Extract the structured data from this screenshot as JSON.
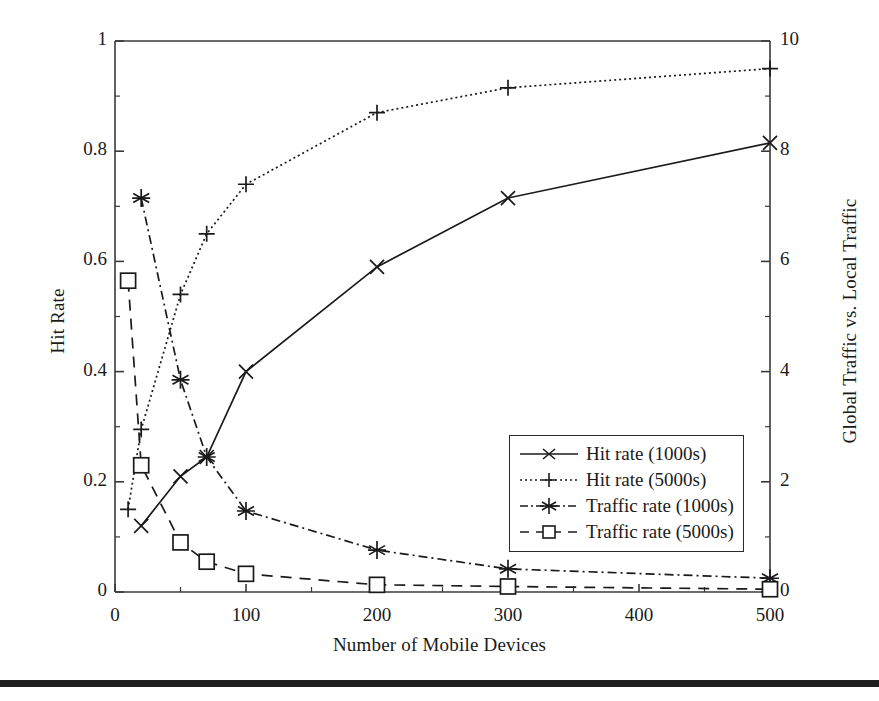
{
  "chart_data": {
    "type": "line",
    "title": "",
    "xlabel": "Number of Mobile Devices",
    "ylabel": "Hit Rate",
    "y2label": "Global Traffic vs. Local Traffic",
    "xlim": [
      0,
      500
    ],
    "ylim": [
      0,
      1
    ],
    "y2lim": [
      0,
      10
    ],
    "xticks": [
      "0",
      "100",
      "200",
      "300",
      "400",
      "500"
    ],
    "xtick_values": [
      0,
      100,
      200,
      300,
      400,
      500
    ],
    "yticks": [
      "0",
      "0.2",
      "0.4",
      "0.6",
      "0.8",
      "1"
    ],
    "ytick_values": [
      0,
      0.2,
      0.4,
      0.6,
      0.8,
      1
    ],
    "y2ticks": [
      "0",
      "2",
      "4",
      "6",
      "8",
      "10"
    ],
    "y2tick_values": [
      0,
      2,
      4,
      6,
      8,
      10
    ],
    "grid": false,
    "legend_position": "center-right",
    "series": [
      {
        "name": "Hit rate (1000s)",
        "axis": "left",
        "marker": "x",
        "dash": "solid",
        "x": [
          20,
          50,
          70,
          100,
          200,
          300,
          500
        ],
        "values": [
          0.12,
          0.21,
          0.245,
          0.4,
          0.59,
          0.715,
          0.815
        ]
      },
      {
        "name": "Hit rate (5000s)",
        "axis": "left",
        "marker": "plus",
        "dash": "dotted",
        "x": [
          10,
          20,
          50,
          70,
          100,
          200,
          300,
          500
        ],
        "values": [
          0.15,
          0.295,
          0.54,
          0.65,
          0.74,
          0.87,
          0.915,
          0.95
        ]
      },
      {
        "name": "Traffic rate (1000s)",
        "axis": "right",
        "marker": "asterisk",
        "dash": "dashdot",
        "x": [
          20,
          50,
          70,
          100,
          200,
          300,
          500
        ],
        "values": [
          7.15,
          3.85,
          2.45,
          1.47,
          0.76,
          0.42,
          0.25
        ]
      },
      {
        "name": "Traffic rate (5000s)",
        "axis": "right",
        "marker": "square",
        "dash": "dashed",
        "x": [
          10,
          20,
          50,
          70,
          100,
          200,
          300,
          500
        ],
        "values": [
          5.65,
          2.3,
          0.9,
          0.55,
          0.33,
          0.13,
          0.1,
          0.05
        ]
      }
    ]
  },
  "legend": {
    "items": [
      {
        "label": "Hit rate (1000s)"
      },
      {
        "label": "Hit rate (5000s)"
      },
      {
        "label": "Traffic rate (1000s)"
      },
      {
        "label": "Traffic rate (5000s)"
      }
    ]
  },
  "colors": {
    "ink": "#1a1a1a",
    "axis": "#3a3a3a",
    "background": "#ffffff",
    "rule": "#1f1f1f"
  }
}
